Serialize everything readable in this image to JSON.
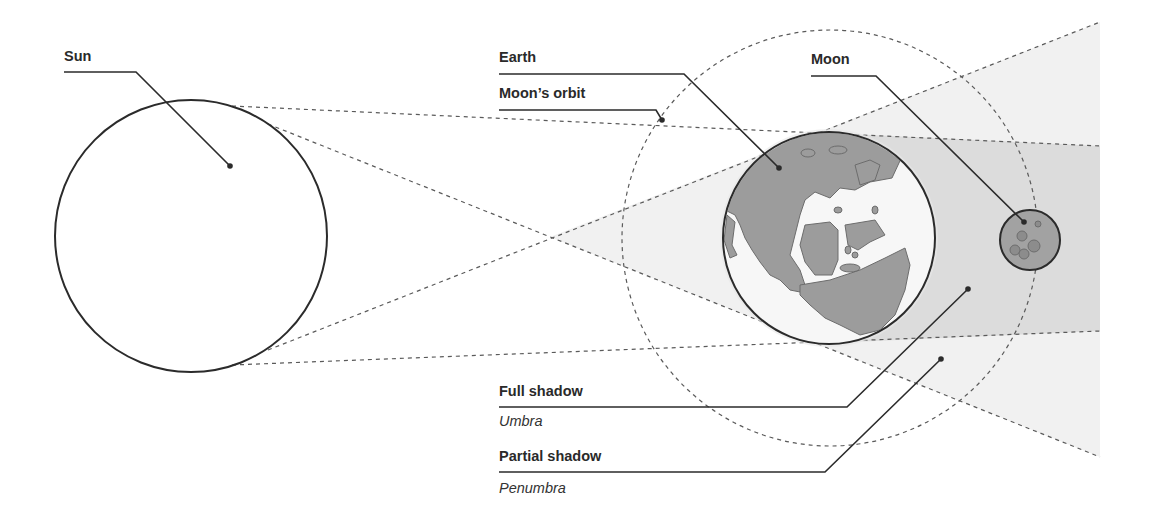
{
  "diagram": {
    "colors": {
      "stroke": "#2b2b2b",
      "dash": "#555555",
      "umbra_fill": "#d9d9d9",
      "penumbra_fill": "#efefef",
      "earth_land": "#9a9a9a",
      "earth_ocean": "#f7f7f7",
      "moon_fill": "#a0a0a0",
      "background": "#ffffff"
    },
    "labels": {
      "sun": "Sun",
      "earth": "Earth",
      "moons_orbit": "Moon’s orbit",
      "moon": "Moon",
      "full_shadow": "Full shadow",
      "umbra": "Umbra",
      "partial_shadow": "Partial shadow",
      "penumbra": "Penumbra"
    },
    "bodies": {
      "sun": {
        "cx": 191,
        "cy": 236,
        "r": 136
      },
      "earth": {
        "cx": 829,
        "cy": 238,
        "r": 106
      },
      "moon": {
        "cx": 1030,
        "cy": 240,
        "r": 30
      },
      "moon_orbit": {
        "cx": 830,
        "cy": 238,
        "r": 208
      }
    }
  }
}
